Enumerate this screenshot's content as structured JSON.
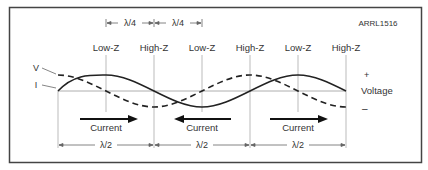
{
  "figure_id": "ARRL1516",
  "top_dimensions": [
    {
      "label": "λ/4",
      "x1": 106,
      "x2": 154
    },
    {
      "label": "λ/4",
      "x1": 154,
      "x2": 202
    }
  ],
  "impedance_labels": [
    {
      "label": "Low-Z",
      "x": 106
    },
    {
      "label": "High-Z",
      "x": 154
    },
    {
      "label": "Low-Z",
      "x": 202
    },
    {
      "label": "High-Z",
      "x": 250
    },
    {
      "label": "Low-Z",
      "x": 298
    },
    {
      "label": "High-Z",
      "x": 346
    }
  ],
  "wave_labels": {
    "voltage": "V",
    "current": "I"
  },
  "voltage_axis": {
    "plus": "+",
    "label": "Voltage",
    "minus": "–"
  },
  "current_arrows": [
    {
      "label": "Current",
      "direction": "right",
      "x1": 80,
      "x2": 137
    },
    {
      "label": "Current",
      "direction": "left",
      "x1": 175,
      "x2": 231
    },
    {
      "label": "Current",
      "direction": "right",
      "x1": 270,
      "x2": 328
    }
  ],
  "bottom_dimensions": [
    {
      "label": "λ/2",
      "x1": 58,
      "x2": 154
    },
    {
      "label": "λ/2",
      "x1": 154,
      "x2": 250
    },
    {
      "label": "λ/2",
      "x1": 250,
      "x2": 346
    }
  ],
  "waves": {
    "x_start": 58,
    "x_end": 346,
    "baseline_y": 91,
    "amplitude": 16,
    "wavelength": 192,
    "current": "solid sine: zero at 58, peak at Low-Z points",
    "voltage": "dashed cosine: peak at 58, zero at Low-Z points"
  },
  "colors": {
    "line": "#222222",
    "guide": "#aaaaaa",
    "text": "#333333",
    "border": "#444444"
  }
}
